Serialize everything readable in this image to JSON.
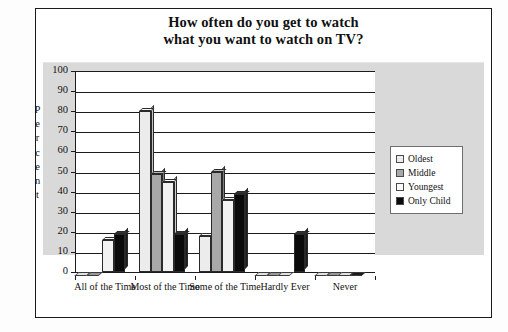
{
  "figure": {
    "title_line_1": "How often do you get to watch",
    "title_line_2": "what you want to watch on TV?"
  },
  "y_axis": {
    "title_letters": [
      "P",
      "e",
      "r",
      "c",
      "e",
      "n",
      "t"
    ],
    "ticks": [
      "100",
      "90",
      "80",
      "70",
      "60",
      "50",
      "40",
      "30",
      "20",
      "10",
      "0"
    ]
  },
  "legend": {
    "items": [
      {
        "label": "Oldest",
        "color": "#ececec"
      },
      {
        "label": "Middle",
        "color": "#a8a8a8"
      },
      {
        "label": "Youngest",
        "color": "#fbfbfb"
      },
      {
        "label": "Only Child",
        "color": "#0b0b0b"
      }
    ]
  },
  "chart_data": {
    "type": "bar",
    "title": "How often do you get to watch what you want to watch on TV?",
    "xlabel": "",
    "ylabel": "Percent",
    "ylim": [
      0,
      100
    ],
    "ytick_step": 10,
    "grid": true,
    "legend_position": "right",
    "categories": [
      "All of the Time",
      "Most of the Time",
      "Some of the Time",
      "Hardly Ever",
      "Never"
    ],
    "series": [
      {
        "name": "Oldest",
        "color": "#ececec",
        "values": [
          0,
          80,
          18,
          0,
          0
        ]
      },
      {
        "name": "Middle",
        "color": "#a8a8a8",
        "values": [
          0,
          49,
          50,
          0,
          0
        ]
      },
      {
        "name": "Youngest",
        "color": "#fbfbfb",
        "values": [
          16,
          45,
          36,
          0,
          0
        ]
      },
      {
        "name": "Only Child",
        "color": "#0b0b0b",
        "values": [
          19,
          19,
          39,
          19,
          0
        ]
      }
    ]
  }
}
